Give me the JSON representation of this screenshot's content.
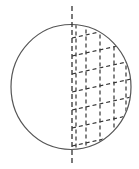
{
  "diagram": {
    "type": "hatched-circle",
    "canvas": {
      "width": 139,
      "height": 169,
      "background": "#ffffff"
    },
    "circle": {
      "cx": 71,
      "cy": 87,
      "rx": 60,
      "ry": 62.5,
      "stroke": "#555555",
      "stroke_width": 1.2
    },
    "axis": {
      "x": 72,
      "y1": 6,
      "y2": 163,
      "stroke": "#333333",
      "dash": "5 3"
    },
    "hatch": {
      "region": "right-half",
      "stroke": "#333333",
      "dash": "4 3",
      "vertical_lines_x": [
        76,
        86,
        100,
        114,
        126
      ],
      "diagonal_slope": -0.22,
      "diagonal_start_y_at_x72": [
        38,
        56,
        74,
        92,
        110,
        128,
        146,
        164
      ]
    }
  }
}
